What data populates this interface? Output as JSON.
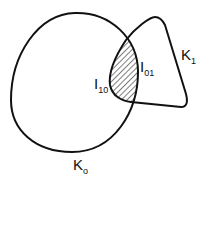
{
  "diagram": {
    "type": "set-intersection",
    "shapes": [
      {
        "id": "K0",
        "label_main": "K",
        "label_sub": "o",
        "description": "large rounded convex body"
      },
      {
        "id": "K1",
        "label_main": "K",
        "label_sub": "1",
        "description": "rounded triangular convex body"
      }
    ],
    "regions": [
      {
        "id": "I10",
        "label_main": "I",
        "label_sub": "10",
        "side": "left boundary of intersection"
      },
      {
        "id": "I01",
        "label_main": "I",
        "label_sub": "01",
        "side": "right boundary of intersection"
      }
    ],
    "intersection_fill": "hatched",
    "colors": {
      "stroke": "#111111",
      "background": "#ffffff"
    }
  }
}
